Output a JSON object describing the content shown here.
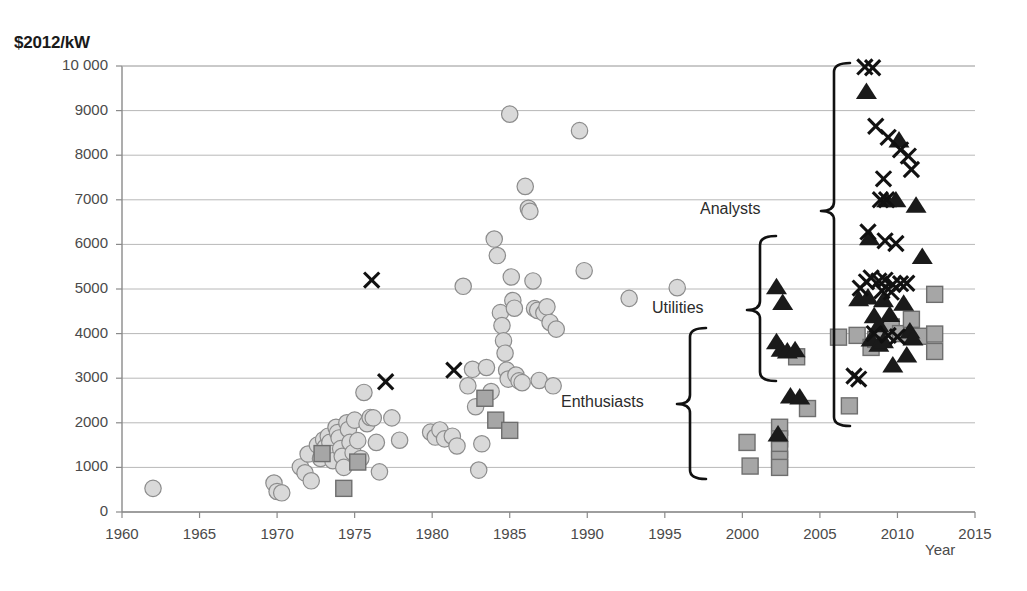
{
  "chart_data": {
    "type": "scatter",
    "title": "",
    "ylabel": "$2012/kW",
    "xlabel": "Year",
    "xlim": [
      1960,
      2015
    ],
    "ylim": [
      0,
      10000
    ],
    "grid": true,
    "legend_position": "none",
    "y_ticks": [
      "0",
      "1000",
      "2000",
      "3000",
      "4000",
      "5000",
      "6000",
      "7000",
      "8000",
      "9000",
      "10 000"
    ],
    "y_tick_values": [
      0,
      1000,
      2000,
      3000,
      4000,
      5000,
      6000,
      7000,
      8000,
      9000,
      10000
    ],
    "x_ticks": [
      "1960",
      "1965",
      "1970",
      "1975",
      "1980",
      "1985",
      "1990",
      "1995",
      "2000",
      "2005",
      "2010",
      "2015"
    ],
    "x_tick_values": [
      1960,
      1965,
      1970,
      1975,
      1980,
      1985,
      1990,
      1995,
      2000,
      2005,
      2010,
      2015
    ],
    "series": [
      {
        "name": "historical-costs",
        "marker": "circle",
        "color": "#d9d9d9",
        "edge_color": "#8c8c8c",
        "points": [
          [
            1962.0,
            530
          ],
          [
            1969.8,
            650
          ],
          [
            1970.0,
            460
          ],
          [
            1970.3,
            430
          ],
          [
            1971.5,
            1010
          ],
          [
            1971.8,
            880
          ],
          [
            1972.0,
            1300
          ],
          [
            1972.2,
            700
          ],
          [
            1972.6,
            1500
          ],
          [
            1972.8,
            1200
          ],
          [
            1973.0,
            1620
          ],
          [
            1973.1,
            1450
          ],
          [
            1973.3,
            1700
          ],
          [
            1973.4,
            1560
          ],
          [
            1973.5,
            1310
          ],
          [
            1973.6,
            1150
          ],
          [
            1973.8,
            1900
          ],
          [
            1973.9,
            1780
          ],
          [
            1974.0,
            1660
          ],
          [
            1974.1,
            1420
          ],
          [
            1974.2,
            1250
          ],
          [
            1974.3,
            1000
          ],
          [
            1974.5,
            2000
          ],
          [
            1974.6,
            1850
          ],
          [
            1974.7,
            1560
          ],
          [
            1974.9,
            1330
          ],
          [
            1975.0,
            2060
          ],
          [
            1975.2,
            1600
          ],
          [
            1975.4,
            1200
          ],
          [
            1975.6,
            2680
          ],
          [
            1975.8,
            1980
          ],
          [
            1976.0,
            2120
          ],
          [
            1976.2,
            2110
          ],
          [
            1976.4,
            1560
          ],
          [
            1976.6,
            900
          ],
          [
            1977.4,
            2110
          ],
          [
            1977.9,
            1610
          ],
          [
            1979.9,
            1790
          ],
          [
            1980.2,
            1680
          ],
          [
            1980.5,
            1840
          ],
          [
            1980.8,
            1640
          ],
          [
            1981.3,
            1700
          ],
          [
            1981.6,
            1480
          ],
          [
            1982.0,
            5060
          ],
          [
            1982.3,
            2830
          ],
          [
            1982.6,
            3200
          ],
          [
            1982.8,
            2360
          ],
          [
            1983.0,
            940
          ],
          [
            1983.2,
            1530
          ],
          [
            1983.5,
            3240
          ],
          [
            1983.8,
            2700
          ],
          [
            1984.0,
            6120
          ],
          [
            1984.2,
            5750
          ],
          [
            1984.4,
            4470
          ],
          [
            1984.5,
            4180
          ],
          [
            1984.6,
            3840
          ],
          [
            1984.7,
            3560
          ],
          [
            1984.8,
            3180
          ],
          [
            1984.9,
            2980
          ],
          [
            1985.0,
            8920
          ],
          [
            1985.1,
            5270
          ],
          [
            1985.2,
            4740
          ],
          [
            1985.3,
            4570
          ],
          [
            1985.4,
            3070
          ],
          [
            1985.6,
            2940
          ],
          [
            1985.8,
            2900
          ],
          [
            1986.0,
            7300
          ],
          [
            1986.2,
            6810
          ],
          [
            1986.3,
            6740
          ],
          [
            1986.5,
            5180
          ],
          [
            1986.6,
            4560
          ],
          [
            1986.8,
            4520
          ],
          [
            1986.9,
            2950
          ],
          [
            1987.2,
            4460
          ],
          [
            1987.4,
            4600
          ],
          [
            1987.6,
            4250
          ],
          [
            1987.8,
            2830
          ],
          [
            1988.0,
            4100
          ],
          [
            1989.5,
            8550
          ],
          [
            1989.8,
            5410
          ],
          [
            1992.7,
            4790
          ],
          [
            1995.8,
            5030
          ]
        ]
      },
      {
        "name": "enthusiast-estimates",
        "marker": "square",
        "color": "#a6a6a6",
        "edge_color": "#6e6e6e",
        "points": [
          [
            1972.9,
            1310
          ],
          [
            1974.3,
            530
          ],
          [
            1975.2,
            1120
          ],
          [
            1983.4,
            2550
          ],
          [
            1984.1,
            2060
          ],
          [
            1985.0,
            1830
          ],
          [
            2000.3,
            1560
          ],
          [
            2000.5,
            1030
          ],
          [
            2002.4,
            1900
          ],
          [
            2002.4,
            1640
          ],
          [
            2002.4,
            1400
          ],
          [
            2002.4,
            1180
          ],
          [
            2002.4,
            1000
          ],
          [
            2003.5,
            3480
          ],
          [
            2004.2,
            2320
          ],
          [
            2006.2,
            3920
          ],
          [
            2006.9,
            2380
          ],
          [
            2007.4,
            3960
          ],
          [
            2008.3,
            3690
          ],
          [
            2008.6,
            3870
          ],
          [
            2009.6,
            4150
          ],
          [
            2010.2,
            4000
          ],
          [
            2010.9,
            4320
          ],
          [
            2011.4,
            3940
          ],
          [
            2012.4,
            4880
          ],
          [
            2012.4,
            3990
          ],
          [
            2012.4,
            3600
          ]
        ]
      },
      {
        "name": "utility-estimates",
        "marker": "triangle",
        "color": "#1a1a1a",
        "points": [
          [
            2002.2,
            5050
          ],
          [
            2002.6,
            4700
          ],
          [
            2002.2,
            3820
          ],
          [
            2002.5,
            3650
          ],
          [
            2002.9,
            3610
          ],
          [
            2003.4,
            3640
          ],
          [
            2003.1,
            2600
          ],
          [
            2003.7,
            2580
          ],
          [
            2002.3,
            1750
          ],
          [
            2007.5,
            4780
          ],
          [
            2008.1,
            4820
          ],
          [
            2008.5,
            4400
          ],
          [
            2008.8,
            4200
          ],
          [
            2008.3,
            3880
          ],
          [
            2008.8,
            3760
          ],
          [
            2009.1,
            4760
          ],
          [
            2009.5,
            4430
          ],
          [
            2009.1,
            3840
          ],
          [
            2008.2,
            6150
          ],
          [
            2009.7,
            3300
          ],
          [
            2010.4,
            4680
          ],
          [
            2010.6,
            3520
          ],
          [
            2010.1,
            8340
          ],
          [
            2011.2,
            6880
          ],
          [
            2011.6,
            5730
          ],
          [
            2008.0,
            9430
          ],
          [
            2009.3,
            7000
          ],
          [
            2009.9,
            7000
          ],
          [
            2010.8,
            4060
          ],
          [
            2011.0,
            3900
          ]
        ]
      },
      {
        "name": "analyst-estimates",
        "marker": "x",
        "color": "#111111",
        "points": [
          [
            1976.1,
            5200
          ],
          [
            1977.0,
            2920
          ],
          [
            1981.4,
            3180
          ],
          [
            2007.2,
            3050
          ],
          [
            2007.5,
            2980
          ],
          [
            2007.9,
            9980
          ],
          [
            2008.4,
            9960
          ],
          [
            2008.6,
            8650
          ],
          [
            2009.4,
            8400
          ],
          [
            2010.2,
            8120
          ],
          [
            2010.7,
            7980
          ],
          [
            2010.9,
            7680
          ],
          [
            2009.1,
            7470
          ],
          [
            2008.9,
            7000
          ],
          [
            2009.3,
            7000
          ],
          [
            2008.1,
            6280
          ],
          [
            2009.2,
            6080
          ],
          [
            2009.9,
            6020
          ],
          [
            2008.3,
            5250
          ],
          [
            2008.8,
            5180
          ],
          [
            2009.2,
            5200
          ],
          [
            2009.7,
            5100
          ],
          [
            2010.2,
            5120
          ],
          [
            2009.0,
            4960
          ],
          [
            2009.6,
            4930
          ],
          [
            2007.6,
            5020
          ],
          [
            2008.0,
            5160
          ],
          [
            2010.6,
            5130
          ],
          [
            2009.4,
            3960
          ],
          [
            2010.0,
            3930
          ],
          [
            2008.5,
            4000
          ]
        ]
      }
    ],
    "annotations": [
      {
        "label": "Analysts",
        "label_x": 700,
        "label_y": 211,
        "bracket_x": 834,
        "bracket_top_y": 63,
        "bracket_bottom_y": 426,
        "bracket_tip_y": 211
      },
      {
        "label": "Utilities",
        "label_x": 652,
        "label_y": 310,
        "bracket_x": 760,
        "bracket_top_y": 236,
        "bracket_bottom_y": 381,
        "bracket_tip_y": 310
      },
      {
        "label": "Enthusiasts",
        "label_x": 561,
        "label_y": 404,
        "bracket_x": 690,
        "bracket_top_y": 328,
        "bracket_bottom_y": 479,
        "bracket_tip_y": 404
      }
    ]
  }
}
